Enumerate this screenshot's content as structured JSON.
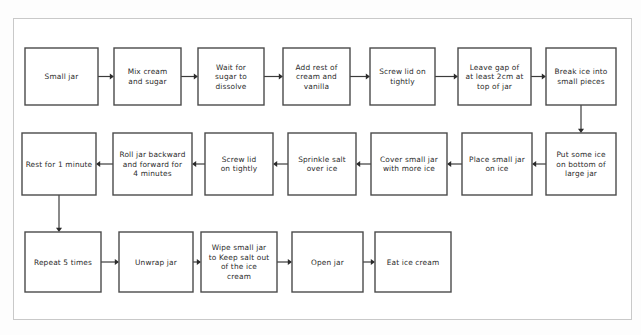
{
  "diagram": {
    "background_color": "#fdfdfd",
    "frame_color": "#c9c9c9",
    "box_fill": "#ffffff",
    "box_stroke": "#4a4a4a",
    "connector_color": "#3c3c3c",
    "text_color": "#2b2b2b",
    "flow_direction": "serpentine",
    "rows": [
      {
        "index": 1,
        "direction": "left-to-right",
        "nodes": [
          {
            "id": "n1",
            "lines": [
              "Small jar"
            ]
          },
          {
            "id": "n2",
            "lines": [
              "Mix cream",
              "and sugar"
            ]
          },
          {
            "id": "n3",
            "lines": [
              "Wait for",
              "sugar to",
              "dissolve"
            ]
          },
          {
            "id": "n4",
            "lines": [
              "Add rest of",
              "cream and",
              "vanilla"
            ]
          },
          {
            "id": "n5",
            "lines": [
              "Screw lid on",
              "tightly"
            ]
          },
          {
            "id": "n6",
            "lines": [
              "Leave gap of",
              "at least 2cm at",
              "top of jar"
            ]
          },
          {
            "id": "n7",
            "lines": [
              "Break ice into",
              "small pieces"
            ]
          }
        ]
      },
      {
        "index": 2,
        "direction": "right-to-left",
        "nodes": [
          {
            "id": "n8",
            "lines": [
              "Put some ice",
              "on bottom of",
              "large jar"
            ]
          },
          {
            "id": "n9",
            "lines": [
              "Place small jar",
              "on ice"
            ]
          },
          {
            "id": "n10",
            "lines": [
              "Cover small jar",
              "with more ice"
            ]
          },
          {
            "id": "n11",
            "lines": [
              "Sprinkle salt",
              "over ice"
            ]
          },
          {
            "id": "n12",
            "lines": [
              "Screw lid",
              "on tightly"
            ]
          },
          {
            "id": "n13",
            "lines": [
              "Roll jar backward",
              "and forward for",
              "4 minutes"
            ]
          },
          {
            "id": "n14",
            "lines": [
              "Rest for 1 minute"
            ]
          }
        ]
      },
      {
        "index": 3,
        "direction": "left-to-right",
        "nodes": [
          {
            "id": "n15",
            "lines": [
              "Repeat 5 times"
            ]
          },
          {
            "id": "n16",
            "lines": [
              "Unwrap jar"
            ]
          },
          {
            "id": "n17",
            "lines": [
              "Wipe small jar",
              "to Keep salt out",
              "of the ice",
              "cream"
            ]
          },
          {
            "id": "n18",
            "lines": [
              "Open jar"
            ]
          },
          {
            "id": "n19",
            "lines": [
              "Eat ice cream"
            ]
          }
        ]
      }
    ],
    "connectors": [
      {
        "id": "c1",
        "from": "n1",
        "to": "n2",
        "kind": "horizontal-right"
      },
      {
        "id": "c2",
        "from": "n2",
        "to": "n3",
        "kind": "horizontal-right"
      },
      {
        "id": "c3",
        "from": "n3",
        "to": "n4",
        "kind": "horizontal-right"
      },
      {
        "id": "c4",
        "from": "n4",
        "to": "n5",
        "kind": "horizontal-right"
      },
      {
        "id": "c5",
        "from": "n5",
        "to": "n6",
        "kind": "horizontal-right"
      },
      {
        "id": "c6",
        "from": "n6",
        "to": "n7",
        "kind": "horizontal-right"
      },
      {
        "id": "c7",
        "from": "n7",
        "to": "n8",
        "kind": "vertical-down"
      },
      {
        "id": "c8",
        "from": "n8",
        "to": "n9",
        "kind": "horizontal-left"
      },
      {
        "id": "c9",
        "from": "n9",
        "to": "n10",
        "kind": "horizontal-left"
      },
      {
        "id": "c10",
        "from": "n10",
        "to": "n11",
        "kind": "horizontal-left"
      },
      {
        "id": "c11",
        "from": "n11",
        "to": "n12",
        "kind": "horizontal-left"
      },
      {
        "id": "c12",
        "from": "n12",
        "to": "n13",
        "kind": "horizontal-left"
      },
      {
        "id": "c13",
        "from": "n13",
        "to": "n14",
        "kind": "horizontal-left"
      },
      {
        "id": "c14",
        "from": "n14",
        "to": "n15",
        "kind": "vertical-down"
      },
      {
        "id": "c15",
        "from": "n15",
        "to": "n16",
        "kind": "horizontal-right"
      },
      {
        "id": "c16",
        "from": "n16",
        "to": "n17",
        "kind": "horizontal-right"
      },
      {
        "id": "c17",
        "from": "n17",
        "to": "n18",
        "kind": "horizontal-right"
      },
      {
        "id": "c18",
        "from": "n18",
        "to": "n19",
        "kind": "horizontal-right"
      }
    ]
  },
  "layout": {
    "rows": [
      {
        "y": 48,
        "height": 57
      },
      {
        "y": 133,
        "height": 62
      },
      {
        "y": 232,
        "height": 60
      }
    ],
    "row1_boxes": [
      {
        "x": 25,
        "w": 73
      },
      {
        "x": 114,
        "w": 67
      },
      {
        "x": 198,
        "w": 66
      },
      {
        "x": 283,
        "w": 67
      },
      {
        "x": 370,
        "w": 65
      },
      {
        "x": 458,
        "w": 73
      },
      {
        "x": 546,
        "w": 70
      }
    ],
    "row2_boxes": [
      {
        "x": 546,
        "w": 70
      },
      {
        "x": 462,
        "w": 70
      },
      {
        "x": 371,
        "w": 76
      },
      {
        "x": 288,
        "w": 68
      },
      {
        "x": 205,
        "w": 68
      },
      {
        "x": 113,
        "w": 79
      },
      {
        "x": 22,
        "w": 74
      }
    ],
    "row3_boxes": [
      {
        "x": 25,
        "w": 76
      },
      {
        "x": 119,
        "w": 74
      },
      {
        "x": 201,
        "w": 76
      },
      {
        "x": 292,
        "w": 71
      },
      {
        "x": 375,
        "w": 76
      }
    ]
  }
}
